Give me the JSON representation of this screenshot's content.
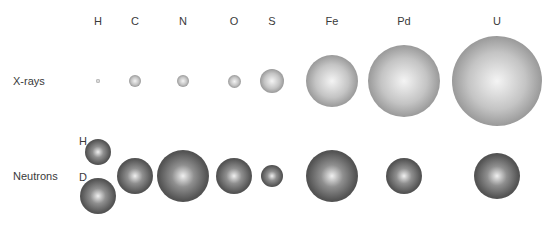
{
  "elements": [
    {
      "symbol": "H",
      "x": 98
    },
    {
      "symbol": "C",
      "x": 135
    },
    {
      "symbol": "N",
      "x": 183
    },
    {
      "symbol": "O",
      "x": 234
    },
    {
      "symbol": "S",
      "x": 272
    },
    {
      "symbol": "Fe",
      "x": 332
    },
    {
      "symbol": "Pd",
      "x": 404
    },
    {
      "symbol": "U",
      "x": 497
    }
  ],
  "header_y": 21,
  "rows": {
    "xrays": {
      "label": "X-rays",
      "y": 81,
      "spheres": [
        {
          "element": "H",
          "x": 98,
          "y": 81,
          "r": 2
        },
        {
          "element": "C",
          "x": 135,
          "y": 81,
          "r": 6
        },
        {
          "element": "N",
          "x": 183,
          "y": 81,
          "r": 6
        },
        {
          "element": "O",
          "x": 234,
          "y": 81,
          "r": 6.5
        },
        {
          "element": "S",
          "x": 272,
          "y": 81,
          "r": 12
        },
        {
          "element": "Fe",
          "x": 332,
          "y": 81,
          "r": 26
        },
        {
          "element": "Pd",
          "x": 404,
          "y": 81,
          "r": 36
        },
        {
          "element": "U",
          "x": 497,
          "y": 81,
          "r": 45
        }
      ]
    },
    "neutrons": {
      "label": "Neutrons",
      "y": 176,
      "isotope_labels": [
        {
          "text": "H",
          "x": 83,
          "y": 141
        },
        {
          "text": "D",
          "x": 83,
          "y": 177
        }
      ],
      "spheres": [
        {
          "element": "H",
          "x": 98,
          "y": 152,
          "r": 13
        },
        {
          "element": "D",
          "x": 98,
          "y": 196,
          "r": 18
        },
        {
          "element": "C",
          "x": 135,
          "y": 176,
          "r": 18
        },
        {
          "element": "N",
          "x": 183,
          "y": 176,
          "r": 26
        },
        {
          "element": "O",
          "x": 234,
          "y": 176,
          "r": 18
        },
        {
          "element": "S",
          "x": 272,
          "y": 176,
          "r": 11
        },
        {
          "element": "Fe",
          "x": 332,
          "y": 176,
          "r": 26
        },
        {
          "element": "Pd",
          "x": 404,
          "y": 176,
          "r": 18
        },
        {
          "element": "U",
          "x": 497,
          "y": 176,
          "r": 23
        }
      ]
    }
  }
}
